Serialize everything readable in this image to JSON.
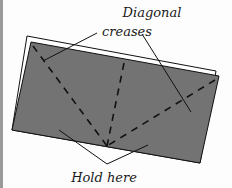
{
  "diagram": {
    "labels": {
      "top_line1": "Diagonal",
      "top_line2": "creases",
      "bottom": "Hold here"
    },
    "colors": {
      "paper_fill": "#737373",
      "paper_back": "#ffffff",
      "outline": "#111111",
      "left_bar": "#9a9a9a"
    }
  }
}
